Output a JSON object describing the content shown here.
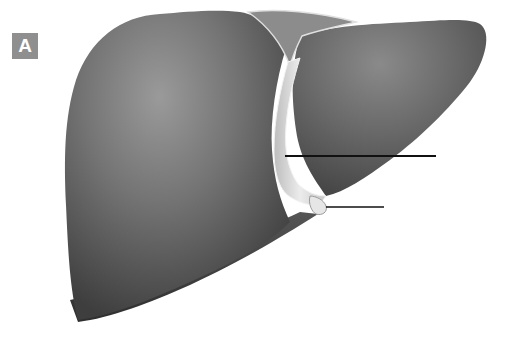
{
  "figure": {
    "panel_label": "A",
    "colors": {
      "organ_dark": "#3a3a3a",
      "organ_mid": "#6e6e6e",
      "organ_light": "#a8a8a8",
      "ligament": "#d9d9d9",
      "badge": "#8f8f8f",
      "leader_line": "#111111"
    },
    "leader_lines": [
      {
        "name": "falciform-ligament-pointer",
        "x1": 285,
        "y1": 156,
        "x2": 436,
        "y2": 156,
        "label": ""
      },
      {
        "name": "round-ligament-pointer",
        "x1": 326,
        "y1": 207,
        "x2": 384,
        "y2": 207,
        "label": ""
      }
    ]
  }
}
